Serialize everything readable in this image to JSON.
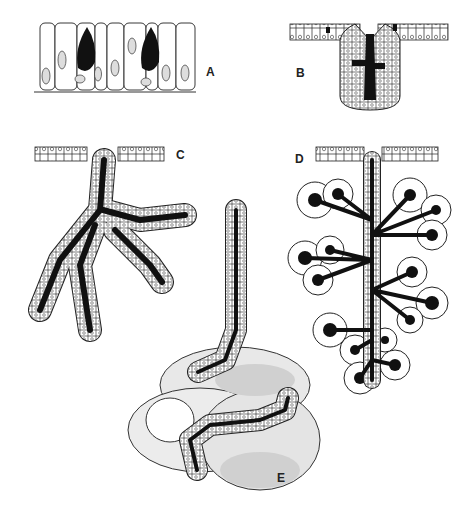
{
  "figure": {
    "panels": [
      {
        "id": "A",
        "label": "A",
        "name": "unicellular-goblet-cells",
        "x": 206,
        "y": 65
      },
      {
        "id": "B",
        "label": "B",
        "name": "simple-tubular-gland",
        "x": 296,
        "y": 66
      },
      {
        "id": "C",
        "label": "C",
        "name": "branched-compound-tubular-gland",
        "x": 176,
        "y": 148
      },
      {
        "id": "D",
        "label": "D",
        "name": "compound-acinar-gland",
        "x": 295,
        "y": 152
      },
      {
        "id": "E",
        "label": "E",
        "name": "coiled-tubular-gland",
        "x": 277,
        "y": 471
      }
    ]
  },
  "colors": {
    "outline": "#222222",
    "lumen": "#111111",
    "cell_fill": "#ffffff",
    "connective_tissue_light": "#e6e6e6",
    "connective_tissue_dark": "#c8c8c8"
  }
}
